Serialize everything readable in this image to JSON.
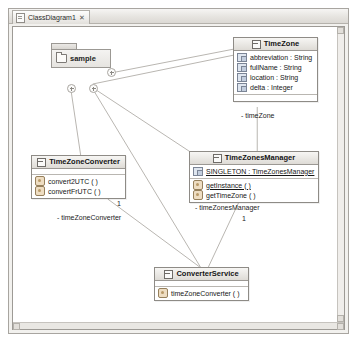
{
  "window": {
    "tab": {
      "label": "ClassDiagram1",
      "close_glyph": "✕",
      "doc_icon": "document-icon"
    }
  },
  "diagram": {
    "package": {
      "name": "sample",
      "icon": "folder-icon"
    },
    "anchors": [
      {
        "name": "anchor-package-right",
        "glyph": "+"
      },
      {
        "name": "anchor-package-bottom-left",
        "glyph": "+"
      },
      {
        "name": "anchor-package-bottom-mid",
        "glyph": "+"
      }
    ],
    "classes": [
      {
        "name": "TimeZone",
        "icon": "class-icon",
        "attributes": [
          {
            "text": "abbreviation : String",
            "icon": "attribute-icon",
            "static": false
          },
          {
            "text": "fullName : String",
            "icon": "attribute-icon",
            "static": false
          },
          {
            "text": "location : String",
            "icon": "attribute-icon",
            "static": false
          },
          {
            "text": "delta : Integer",
            "icon": "attribute-icon",
            "static": false
          }
        ],
        "operations": []
      },
      {
        "name": "TimeZoneConverter",
        "icon": "class-icon",
        "attributes": [],
        "operations": [
          {
            "text": "convert2UTC ( )",
            "icon": "method-icon",
            "static": false
          },
          {
            "text": "convertFrUTC ( )",
            "icon": "method-icon",
            "static": false
          }
        ]
      },
      {
        "name": "TimeZonesManager",
        "icon": "class-icon",
        "attributes": [
          {
            "text": "SINGLETON : TimeZonesManager",
            "icon": "attribute-icon",
            "static": true
          }
        ],
        "operations": [
          {
            "text": "getInstance ( )",
            "icon": "method-icon",
            "static": true
          },
          {
            "text": "getTimeZone ( )",
            "icon": "method-icon",
            "static": false
          }
        ]
      },
      {
        "name": "ConverterService",
        "icon": "class-icon",
        "attributes": [],
        "operations": [
          {
            "text": "timeZoneConverter ( )",
            "icon": "method-icon",
            "static": false
          }
        ]
      }
    ],
    "edge_labels": [
      {
        "name": "role-timezone",
        "text": "- timeZone"
      },
      {
        "name": "role-timezoneconverter",
        "text": "- timeZoneConverter"
      },
      {
        "name": "multiplicity-timezoneconverter",
        "text": "1"
      },
      {
        "name": "role-timezonesmanager",
        "text": "- timeZonesManager"
      },
      {
        "name": "multiplicity-timezonesmanager",
        "text": "1"
      }
    ]
  }
}
